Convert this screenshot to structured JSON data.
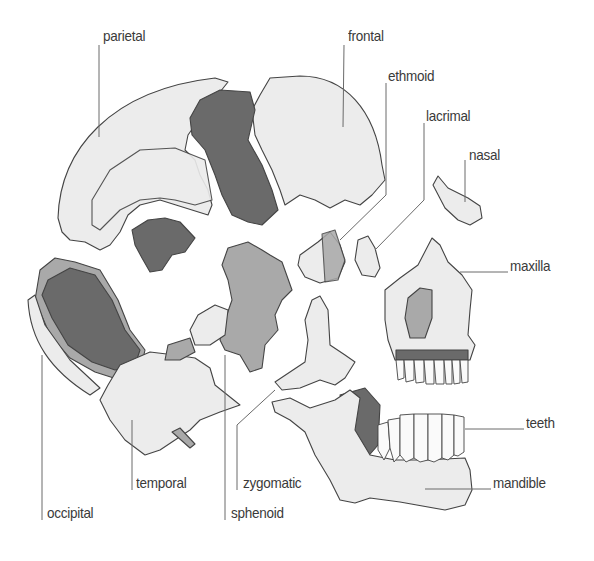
{
  "diagram": {
    "title": "",
    "colors": {
      "background": "#ffffff",
      "bone_light": "#ececec",
      "bone_mid": "#a9a9a9",
      "bone_dark": "#6a6a6a",
      "outline": "#444444",
      "label_text": "#3a3a3a",
      "leader_line": "#6a6a6a"
    },
    "labels": [
      {
        "id": "parietal",
        "text": "parietal"
      },
      {
        "id": "frontal",
        "text": "frontal"
      },
      {
        "id": "ethmoid",
        "text": "ethmoid"
      },
      {
        "id": "lacrimal",
        "text": "lacrimal"
      },
      {
        "id": "nasal",
        "text": "nasal"
      },
      {
        "id": "maxilla",
        "text": "maxilla"
      },
      {
        "id": "teeth",
        "text": "teeth"
      },
      {
        "id": "mandible",
        "text": "mandible"
      },
      {
        "id": "occipital",
        "text": "occipital"
      },
      {
        "id": "temporal",
        "text": "temporal"
      },
      {
        "id": "zygomatic",
        "text": "zygomatic"
      },
      {
        "id": "sphenoid",
        "text": "sphenoid"
      }
    ]
  }
}
